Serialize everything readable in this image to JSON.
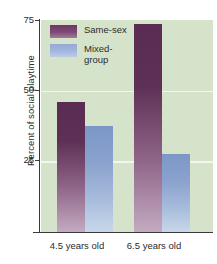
{
  "chart_data": {
    "type": "bar",
    "title": "",
    "xlabel": "",
    "ylabel": "Percent of social playtime",
    "categories": [
      "4.5 years old",
      "6.5 years old"
    ],
    "series": [
      {
        "name": "Same-sex",
        "values": [
          46,
          73.5
        ],
        "color": "#5a2c53"
      },
      {
        "name": "Mixed-group",
        "values": [
          37.5,
          27.5
        ],
        "color": "#7c97c7"
      }
    ],
    "ylim": [
      0,
      75
    ],
    "yticks": [
      25,
      50,
      75
    ],
    "ytick_labels": [
      "25",
      "50",
      "75"
    ],
    "gridlines": [
      25,
      50
    ],
    "grid": true,
    "legend_position": "top-left-inside",
    "plot_background": "#d6e3cb",
    "gridline_color": "#f2f6ee"
  },
  "axes": {
    "y_title": "Percent of social playtime",
    "y_ticks": [
      {
        "label": "75",
        "value": 75
      },
      {
        "label": "50",
        "value": 50
      },
      {
        "label": "25",
        "value": 25
      }
    ],
    "x_ticks": [
      {
        "label": "4.5 years old"
      },
      {
        "label": "6.5 years old"
      }
    ]
  },
  "legend": {
    "items": [
      {
        "label": "Same-sex",
        "label_line2": "",
        "swatch": "purple-swatch"
      },
      {
        "label": "Mixed-",
        "label_line2": "group",
        "swatch": "blue-swatch"
      }
    ]
  }
}
